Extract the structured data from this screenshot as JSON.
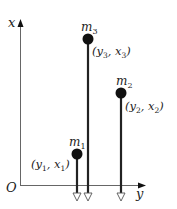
{
  "diagram": {
    "type": "mass-system-coordinate-diagram",
    "axes": {
      "vertical_label": "x",
      "horizontal_label": "y",
      "origin_label": "O",
      "color": "#555555"
    },
    "masses": [
      {
        "name": "m",
        "sub": "1",
        "coord_open": "(y",
        "coord_sub1": "1",
        "coord_mid": ", x",
        "coord_sub2": "1",
        "coord_close": ")",
        "ball_x": 77,
        "ball_y": 154
      },
      {
        "name": "m",
        "sub": "2",
        "coord_open": "(y",
        "coord_sub1": "2",
        "coord_mid": ", x",
        "coord_sub2": "2",
        "coord_close": ")",
        "ball_x": 121,
        "ball_y": 93
      },
      {
        "name": "m",
        "sub": "3",
        "coord_open": "(y",
        "coord_sub1": "3",
        "coord_mid": ", x",
        "coord_sub2": "3",
        "coord_close": ")",
        "ball_x": 88,
        "ball_y": 39
      }
    ],
    "ball_color": "#111111",
    "line_color": "#222222"
  }
}
